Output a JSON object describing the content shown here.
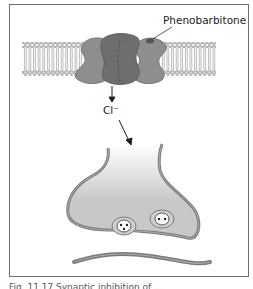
{
  "figure": {
    "labels": {
      "drug": "Phenobarbitone",
      "ion": "Cl⁻"
    },
    "caption": "Fig. 11.17 Synaptic inhibition of ...",
    "colors": {
      "frame": "#6f6f6f",
      "membrane_head": "#bdbdbd",
      "protein_light": "#8c8c8c",
      "protein_dark": "#6c6c6c",
      "neuron_fill": "#c8c8c8",
      "neuron_outline": "#7a7a7a"
    }
  }
}
